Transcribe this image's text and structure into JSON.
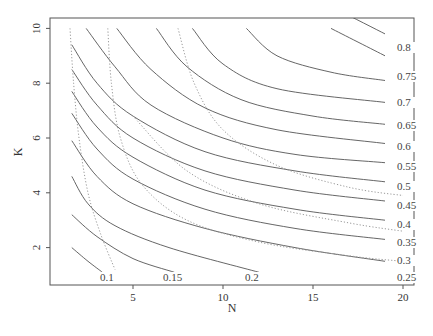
{
  "chart_data": {
    "type": "contour",
    "title": "",
    "xlabel": "N",
    "ylabel": "K",
    "xlim": [
      1,
      20
    ],
    "ylim": [
      1,
      10
    ],
    "x_ticks": [
      5,
      10,
      15,
      20
    ],
    "y_ticks": [
      2,
      4,
      6,
      8,
      10
    ],
    "grid": false,
    "legend": null,
    "contour_levels": [
      0.1,
      0.15,
      0.2,
      0.25,
      0.3,
      0.35,
      0.4,
      0.45,
      0.5,
      0.55,
      0.6,
      0.65,
      0.7,
      0.75,
      0.8
    ],
    "contour_labels": [
      "0.1",
      "0.15",
      "0.2",
      "0.25",
      "0.3",
      "0.35",
      "0.4",
      "0.45",
      "0.5",
      "0.55",
      "0.6",
      "0.65",
      "0.7",
      "0.75",
      "0.8"
    ],
    "solid_contours": [
      {
        "level": 0.1,
        "points": [
          [
            1.6,
            2.0
          ],
          [
            2.5,
            1.5
          ],
          [
            3.3,
            1.1
          ]
        ]
      },
      {
        "level": 0.15,
        "points": [
          [
            1.6,
            3.2
          ],
          [
            3,
            2.4
          ],
          [
            5,
            1.6
          ],
          [
            7.3,
            1.1
          ]
        ]
      },
      {
        "level": 0.2,
        "points": [
          [
            1.6,
            4.6
          ],
          [
            2.5,
            3.6
          ],
          [
            4,
            2.8
          ],
          [
            7,
            2
          ],
          [
            12,
            1.1
          ]
        ]
      },
      {
        "level": 0.25,
        "points": [
          [
            1.6,
            5.9
          ],
          [
            3,
            4.6
          ],
          [
            5,
            3.6
          ],
          [
            9,
            2.7
          ],
          [
            14,
            2.0
          ],
          [
            19,
            1.5
          ]
        ]
      },
      {
        "level": 0.3,
        "points": [
          [
            1.6,
            6.9
          ],
          [
            3,
            5.6
          ],
          [
            5,
            4.5
          ],
          [
            9,
            3.4
          ],
          [
            14,
            2.7
          ],
          [
            19,
            2.3
          ]
        ]
      },
      {
        "level": 0.35,
        "points": [
          [
            1.6,
            7.7
          ],
          [
            3,
            6.4
          ],
          [
            5,
            5.3
          ],
          [
            9,
            4.1
          ],
          [
            14,
            3.4
          ],
          [
            19,
            3.0
          ]
        ]
      },
      {
        "level": 0.4,
        "points": [
          [
            1.6,
            8.5
          ],
          [
            3,
            7.2
          ],
          [
            5,
            6.0
          ],
          [
            9,
            4.8
          ],
          [
            14,
            4.1
          ],
          [
            19,
            3.7
          ]
        ]
      },
      {
        "level": 0.45,
        "points": [
          [
            1.6,
            9.4
          ],
          [
            3,
            8.0
          ],
          [
            5,
            6.8
          ],
          [
            9,
            5.5
          ],
          [
            14,
            4.8
          ],
          [
            19,
            4.4
          ]
        ]
      },
      {
        "level": 0.5,
        "points": [
          [
            2.4,
            10
          ],
          [
            4,
            8.6
          ],
          [
            6,
            7.2
          ],
          [
            10,
            6.0
          ],
          [
            14,
            5.4
          ],
          [
            19,
            5.1
          ]
        ]
      },
      {
        "level": 0.55,
        "points": [
          [
            4.1,
            10
          ],
          [
            6,
            8.5
          ],
          [
            9,
            7.1
          ],
          [
            13,
            6.3
          ],
          [
            19,
            5.8
          ]
        ]
      },
      {
        "level": 0.6,
        "points": [
          [
            6.3,
            10
          ],
          [
            8,
            8.6
          ],
          [
            11,
            7.4
          ],
          [
            15,
            6.8
          ],
          [
            19,
            6.5
          ]
        ]
      },
      {
        "level": 0.65,
        "points": [
          [
            8.3,
            10
          ],
          [
            10,
            8.7
          ],
          [
            13,
            7.8
          ],
          [
            19,
            7.3
          ]
        ]
      },
      {
        "level": 0.7,
        "points": [
          [
            11.3,
            10
          ],
          [
            13,
            9.0
          ],
          [
            16,
            8.4
          ],
          [
            19,
            8.1
          ]
        ]
      },
      {
        "level": 0.75,
        "points": [
          [
            16,
            10
          ],
          [
            19,
            9.0
          ]
        ]
      },
      {
        "level": 0.8,
        "points": [
          [
            16.6,
            10.6
          ],
          [
            19,
            9.8
          ]
        ]
      }
    ],
    "dotted_contours_note": "Secondary dotted gray contours run roughly parallel to solid ones (e.g. near N≈1.5 vertical, N≈3, N≈6 → curving to bottom right)"
  },
  "axes": {
    "x_title": "N",
    "y_title": "K",
    "x_tick_labels": [
      "5",
      "10",
      "15",
      "20"
    ],
    "y_tick_labels": [
      "2",
      "4",
      "6",
      "8",
      "10"
    ]
  }
}
